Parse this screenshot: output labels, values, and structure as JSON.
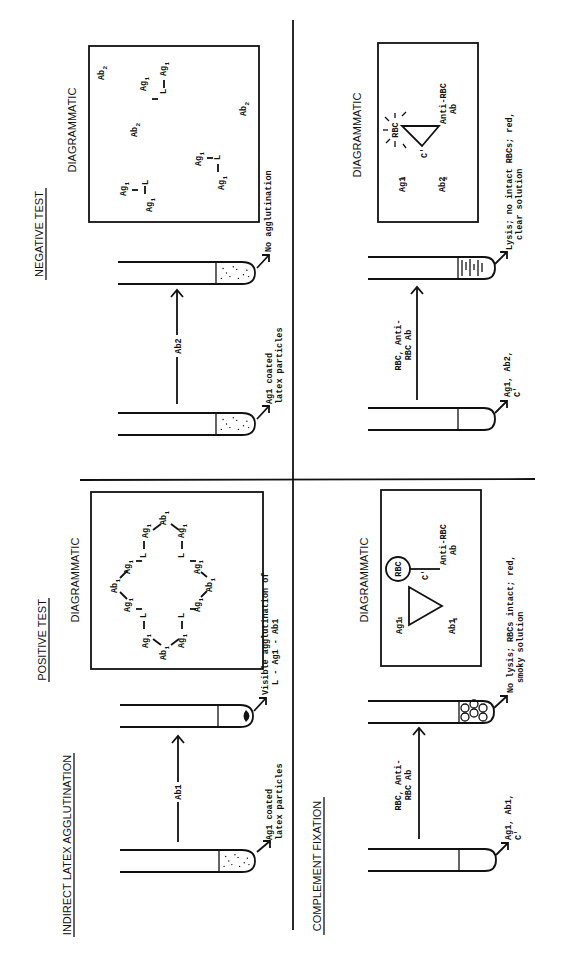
{
  "headings": {
    "positive_test": "POSITIVE TEST",
    "negative_test": "NEGATIVE TEST",
    "latex": "INDIRECT LATEX AGGLUTINATION",
    "complement": "COMPLEMENT FIXATION",
    "diagrammatic": "DIAGRAMMATIC"
  },
  "positive_latex": {
    "start_label": [
      "Ag1 coated",
      "latex particles"
    ],
    "reagent": "Ab1",
    "result_label": [
      "Visible agglutination of",
      "L - Ag1 - Ab1"
    ],
    "diagram": {
      "ab": "Ab1",
      "ag": "Ag1",
      "l": "L"
    }
  },
  "negative_latex": {
    "start_label": [
      "Ag1 coated",
      "latex particles"
    ],
    "reagent": "Ab2",
    "result_label": [
      "No agglutination"
    ],
    "diagram": {
      "ab": "Ab2",
      "ag": "Ag1",
      "l": "L"
    }
  },
  "positive_cf": {
    "start_label": [
      "Ag1, Ab1,",
      "C'"
    ],
    "reagent": [
      "RBC, Anti-",
      "RBC Ab"
    ],
    "result_label": [
      "No lysis; RBCs intact; red,",
      "smoky solution"
    ],
    "diagram": {
      "ag": "Ag1",
      "ab": "Ab1",
      "c": "C'",
      "rbc": "RBC",
      "anti": [
        "Anti-RBC",
        "Ab"
      ]
    }
  },
  "negative_cf": {
    "start_label": [
      "Ag1, Ab2,",
      "C'"
    ],
    "reagent": [
      "RBC, Anti-",
      "RBC Ab"
    ],
    "result_label": [
      "Lysis; no intact RBCs; red,",
      "clear solution"
    ],
    "diagram": {
      "ag": "Ag1",
      "ab": "Ab2",
      "c": "C'",
      "rbc": "RBC",
      "anti": [
        "Anti-RBC",
        "Ab"
      ]
    }
  }
}
